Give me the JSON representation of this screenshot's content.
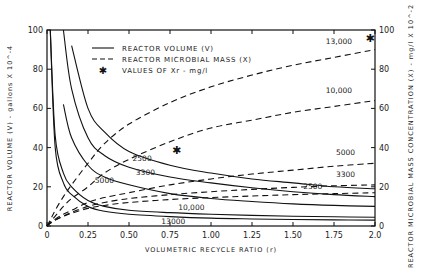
{
  "chart_data": {
    "type": "line",
    "title": "",
    "xlabel": "VOLUMETRIC RECYCLE RATIO (r)",
    "ylabel": "REACTOR VOLUME (V) - gallons X 10^-4",
    "ylabel_right": "REACTOR MICROBIAL MASS CONCENTRATION (X) - mg/l X 10^-2",
    "xlim": [
      0,
      2.0
    ],
    "ylim": [
      0,
      100
    ],
    "ylim_right": [
      0,
      100
    ],
    "x_ticks": [
      "0",
      "0.25",
      "0.50",
      "0.75",
      "1.00",
      "1.25",
      "1.50",
      "1.75",
      "2.0"
    ],
    "x_tick_values": [
      0,
      0.25,
      0.5,
      0.75,
      1.0,
      1.25,
      1.5,
      1.75,
      2.0
    ],
    "y_ticks": [
      "0",
      "20",
      "40",
      "60",
      "80",
      "100"
    ],
    "y_ticks_right": [
      "0",
      "20",
      "40",
      "60",
      "80",
      "100"
    ],
    "grid": false,
    "legend": {
      "position": "upper-center",
      "entries": [
        {
          "style": "solid",
          "label": "REACTOR VOLUME (V)"
        },
        {
          "style": "dashed",
          "label": "REACTOR MICROBIAL MASS (X)"
        },
        {
          "style": "star",
          "label": "VALUES OF Xr - mg/l"
        }
      ]
    },
    "x": [
      0.02,
      0.05,
      0.1,
      0.15,
      0.25,
      0.35,
      0.5,
      0.75,
      1.0,
      1.25,
      1.5,
      1.75,
      2.0
    ],
    "series": [
      {
        "name": "V, Xr=2500",
        "style": "solid",
        "axis": "left",
        "values": [
          null,
          null,
          null,
          92,
          60,
          48,
          38,
          31,
          27,
          24,
          22,
          20,
          19
        ]
      },
      {
        "name": "V, Xr=3300",
        "style": "solid",
        "axis": "left",
        "values": [
          null,
          null,
          100,
          70,
          45,
          36,
          30,
          25,
          22,
          19.5,
          17.5,
          16,
          15
        ]
      },
      {
        "name": "V, Xr=5000",
        "style": "solid",
        "axis": "left",
        "values": [
          null,
          null,
          62,
          45,
          31,
          25,
          21,
          16.5,
          14,
          12.5,
          11.3,
          10.5,
          10
        ]
      },
      {
        "name": "V, Xr=10000",
        "style": "solid",
        "axis": "left",
        "values": [
          100,
          46,
          27,
          20,
          13,
          10,
          8,
          6.8,
          6,
          5.4,
          5,
          4.7,
          4.5
        ]
      },
      {
        "name": "V, Xr=13000",
        "style": "solid",
        "axis": "left",
        "values": [
          100,
          40,
          22,
          16,
          10,
          7.5,
          6,
          4.8,
          4,
          3.6,
          3.3,
          3.1,
          3
        ]
      },
      {
        "name": "X, Xr=13000",
        "style": "dashed",
        "axis": "right",
        "values": [
          3,
          8,
          15,
          21,
          32,
          42,
          52,
          63,
          71,
          77,
          82,
          86,
          90
        ]
      },
      {
        "name": "X, Xr=10000",
        "style": "dashed",
        "axis": "right",
        "values": [
          2,
          5,
          10,
          14,
          20,
          27,
          34,
          43,
          50,
          54,
          58,
          61,
          64
        ]
      },
      {
        "name": "X, Xr=5000",
        "style": "dashed",
        "axis": "right",
        "values": [
          1.5,
          3.5,
          6,
          8,
          12,
          14.5,
          17,
          21,
          24,
          26.5,
          28.5,
          30.5,
          32
        ]
      },
      {
        "name": "X, Xr=3300",
        "style": "dashed",
        "axis": "right",
        "values": [
          1.5,
          3,
          5,
          7,
          10,
          12,
          14,
          16,
          17.5,
          18.7,
          19.7,
          20.5,
          21
        ]
      },
      {
        "name": "X, Xr=2500",
        "style": "dashed",
        "axis": "right",
        "values": [
          1.5,
          3,
          5,
          6.5,
          9,
          10.5,
          12,
          13.5,
          14.5,
          15.3,
          16,
          16.5,
          17
        ]
      }
    ],
    "markers": [
      {
        "label": "star",
        "r": 0.79,
        "value": 39
      },
      {
        "label": "star",
        "r": 1.97,
        "value": 96
      }
    ],
    "annotations": [
      {
        "text": "13,000",
        "near": "upper-right dashed",
        "r": 1.78,
        "y": 93
      },
      {
        "text": "10,000",
        "near": "right dashed",
        "r": 1.78,
        "y": 68
      },
      {
        "text": "5000",
        "near": "right dashed",
        "r": 1.82,
        "y": 36
      },
      {
        "text": "3300",
        "near": "right dashed",
        "r": 1.82,
        "y": 25
      },
      {
        "text": "2500",
        "near": "right solid/dashed",
        "r": 1.62,
        "y": 19
      },
      {
        "text": "2500",
        "near": "solid mid",
        "r": 0.58,
        "y": 33
      },
      {
        "text": "3300",
        "near": "solid mid",
        "r": 0.6,
        "y": 26
      },
      {
        "text": "5000",
        "near": "solid mid",
        "r": 0.35,
        "y": 22
      },
      {
        "text": "10,000",
        "near": "solid low",
        "r": 0.88,
        "y": 8
      },
      {
        "text": "13000",
        "near": "solid lowest",
        "r": 0.77,
        "y": 1
      }
    ]
  }
}
